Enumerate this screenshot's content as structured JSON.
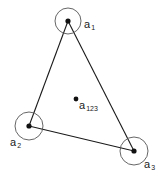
{
  "diagram": {
    "type": "triangle-with-circled-vertices",
    "colors": {
      "line": "#1a1a1a",
      "circle": "#555555",
      "point": "#111111",
      "background": "#ffffff"
    },
    "vertices": [
      {
        "id": "a1",
        "label": "a",
        "subscript": "1",
        "x": 68,
        "y": 21,
        "circle_r": 13
      },
      {
        "id": "a2",
        "label": "a",
        "subscript": "2",
        "x": 29,
        "y": 126,
        "circle_r": 14
      },
      {
        "id": "a3",
        "label": "a",
        "subscript": "3",
        "x": 134,
        "y": 151,
        "circle_r": 14
      }
    ],
    "centroid": {
      "id": "a123",
      "label": "a",
      "subscript": "123",
      "x": 76,
      "y": 99
    },
    "edges": [
      [
        "a1",
        "a2"
      ],
      [
        "a2",
        "a3"
      ],
      [
        "a3",
        "a1"
      ]
    ]
  }
}
